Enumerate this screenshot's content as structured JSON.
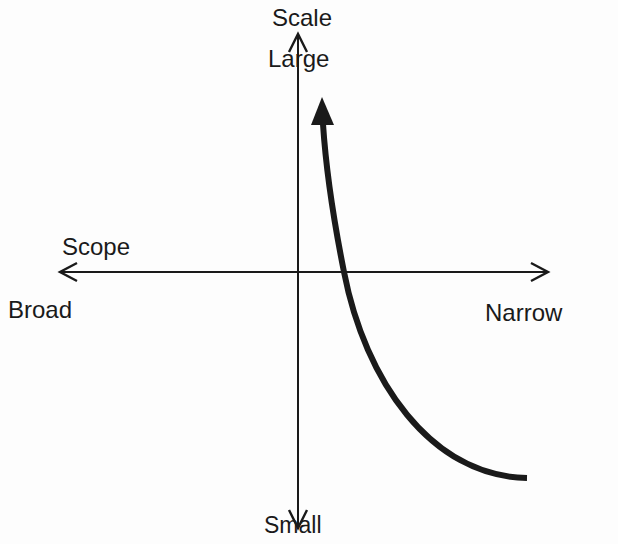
{
  "diagram": {
    "vertical_axis": {
      "name_label": "Scale",
      "positive_end_label": "Large",
      "negative_end_label": "Small"
    },
    "horizontal_axis": {
      "name_label": "Scope",
      "negative_end_label": "Broad",
      "positive_end_label": "Narrow"
    },
    "curve": {
      "description": "Thick curved arrow rising from lower-right (narrow scope, small scale) toward upper area (large scale), arrowhead at top",
      "direction": "upward"
    },
    "colors": {
      "background": "#fdfdfd",
      "ink": "#1a1a1a"
    }
  }
}
